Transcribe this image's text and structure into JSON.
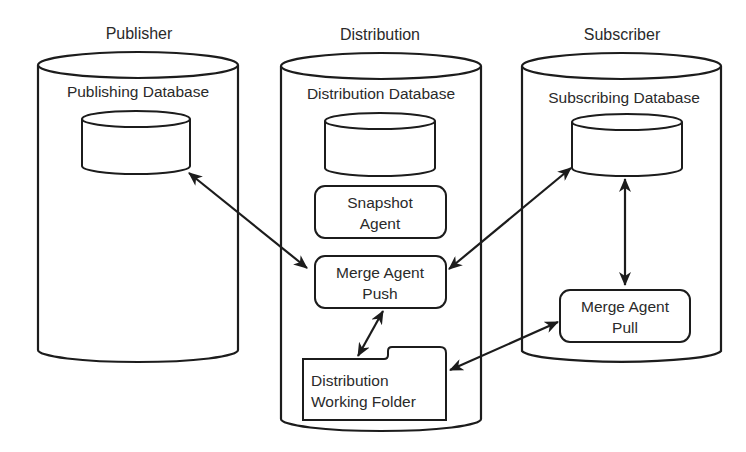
{
  "diagram": {
    "colors": {
      "stroke": "#1c1c1c",
      "text": "#2a2a2a",
      "background": "#ffffff"
    },
    "sections": [
      {
        "id": "publisher",
        "title": "Publisher",
        "db_label": "Publishing Database"
      },
      {
        "id": "distribution",
        "title": "Distribution",
        "db_label": "Distribution Database"
      },
      {
        "id": "subscriber",
        "title": "Subscriber",
        "db_label": "Subscribing Database"
      }
    ],
    "components": {
      "snapshot_agent": {
        "line1": "Snapshot",
        "line2": "Agent"
      },
      "merge_agent_push": {
        "line1": "Merge Agent",
        "line2": "Push"
      },
      "merge_agent_pull": {
        "line1": "Merge Agent",
        "line2": "Pull"
      },
      "working_folder": {
        "line1": "Distribution",
        "line2": "Working Folder"
      }
    },
    "connections": [
      {
        "from": "publishing-database",
        "to": "merge-agent-push",
        "type": "bidirectional"
      },
      {
        "from": "subscribing-database",
        "to": "merge-agent-push",
        "type": "bidirectional"
      },
      {
        "from": "merge-agent-push",
        "to": "distribution-working-folder",
        "type": "bidirectional"
      },
      {
        "from": "merge-agent-pull",
        "to": "distribution-working-folder",
        "type": "bidirectional"
      },
      {
        "from": "subscribing-database",
        "to": "merge-agent-pull",
        "type": "bidirectional"
      }
    ]
  }
}
